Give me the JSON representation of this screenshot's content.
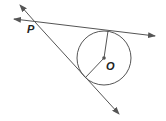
{
  "diagram": {
    "type": "circle with two tangent lines from external point",
    "labels": {
      "external_point": "P",
      "center": "O"
    },
    "colors": {
      "line": "#555555",
      "text": "#222222"
    },
    "elements": [
      "circle centered at O",
      "tangent line through P (upper)",
      "tangent line through P (lower)",
      "radius to upper tangent point",
      "radius to lower tangent point"
    ]
  }
}
